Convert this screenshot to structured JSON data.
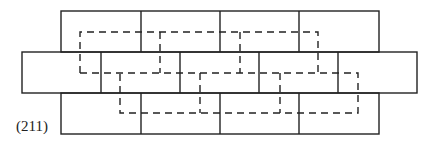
{
  "figure": {
    "label": "(211)",
    "stroke_color": "#222222",
    "rows": [
      {
        "name": "top",
        "y": 11,
        "h": 41,
        "x_start": 61,
        "x_end": 379,
        "dividers": [
          141,
          220,
          299
        ]
      },
      {
        "name": "middle",
        "y": 52,
        "h": 41,
        "x_start": 22,
        "x_end": 417,
        "dividers": [
          101,
          180,
          259,
          338
        ]
      },
      {
        "name": "bottom",
        "y": 93,
        "h": 41,
        "x_start": 61,
        "x_end": 379,
        "dividers": [
          141,
          220,
          299
        ]
      }
    ],
    "dashed_paths": [
      "M80,73 L80,32 L318,32 L318,73",
      "M160,32 L160,73",
      "M240,32 L240,73",
      "M80,73 L358,73 L358,113 L120,113 L120,73",
      "M200,73 L200,113",
      "M280,73 L280,113"
    ]
  }
}
